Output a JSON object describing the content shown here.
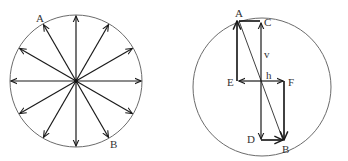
{
  "figure": {
    "left_panel": {
      "description": "Circle with twelve radial arrows from the center at equal angular spacing",
      "arrow_count": 12,
      "labels": {
        "A": "A",
        "B": "B"
      }
    },
    "right_panel": {
      "description": "Circle with diameter AB decomposed into vertical component v and horizontal component h",
      "labels": {
        "A": "A",
        "B": "B",
        "C": "C",
        "D": "D",
        "E": "E",
        "F": "F",
        "v": "v",
        "h": "h"
      }
    }
  }
}
